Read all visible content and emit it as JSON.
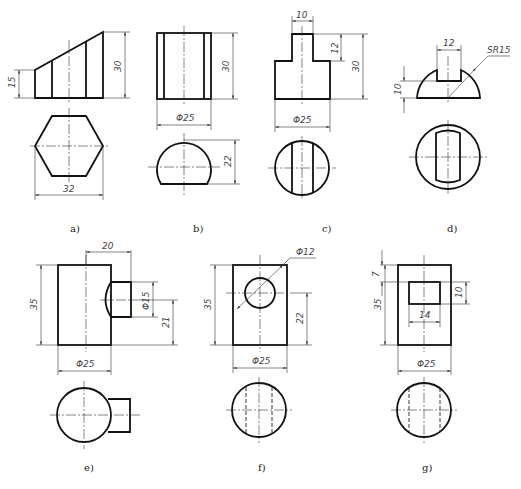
{
  "figure": {
    "panels": [
      {
        "id": "a",
        "caption": "a)",
        "dims": {
          "left_height": "15",
          "total_height": "30",
          "hex_width": "32"
        }
      },
      {
        "id": "b",
        "caption": "b)",
        "dims": {
          "height": "30",
          "diameter": "Φ25",
          "cut_height": "22"
        }
      },
      {
        "id": "c",
        "caption": "c)",
        "dims": {
          "slot_width": "10",
          "step_height": "12",
          "height": "30",
          "diameter": "Φ25"
        }
      },
      {
        "id": "d",
        "caption": "d)",
        "dims": {
          "slot_width": "12",
          "sphere_radius": "SR15",
          "slot_depth": "10"
        }
      },
      {
        "id": "e",
        "caption": "e)",
        "dims": {
          "branch_length": "20",
          "height": "35",
          "branch_diameter": "Φ15",
          "branch_height": "21",
          "diameter": "Φ25"
        }
      },
      {
        "id": "f",
        "caption": "f)",
        "dims": {
          "hole_diameter": "Φ12",
          "height": "35",
          "hole_height": "22",
          "diameter": "Φ25"
        }
      },
      {
        "id": "g",
        "caption": "g)",
        "dims": {
          "top_offset": "7",
          "height": "35",
          "window_height": "10",
          "window_width": "14",
          "diameter": "Φ25"
        }
      }
    ]
  }
}
